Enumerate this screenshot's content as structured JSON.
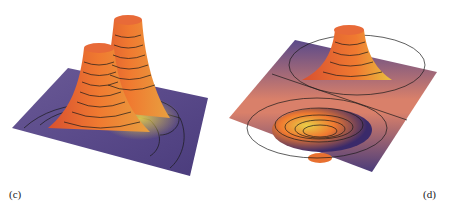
{
  "figure": {
    "panels": [
      {
        "id": "c",
        "label": "(c)",
        "description": "3D surface plot with two tall peaks and contour lines",
        "colors": {
          "surface_low": "#5a4a8a",
          "surface_mid": "#e8603a",
          "surface_high": "#f07a30",
          "highlight": "#e8d048",
          "contour": "#1a1a1a"
        }
      },
      {
        "id": "d",
        "label": "(d)",
        "description": "3D surface plot with one peak and one trough (dipole) with contour lines",
        "colors": {
          "surface_low": "#4a3c7a",
          "surface_mid": "#d9806a",
          "surface_high": "#f07a30",
          "highlight": "#e8d048",
          "contour": "#1a1a1a"
        }
      }
    ]
  }
}
